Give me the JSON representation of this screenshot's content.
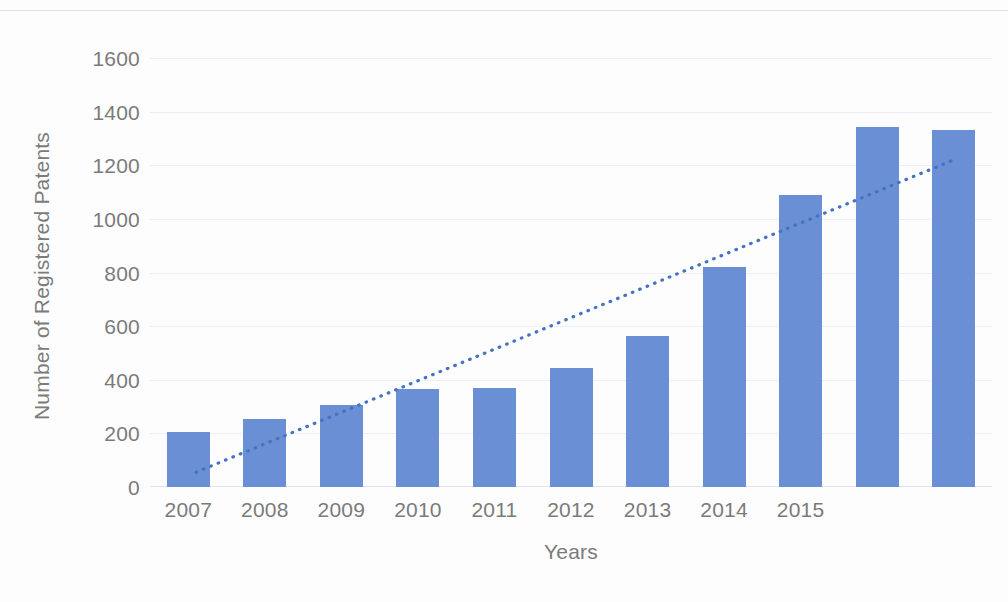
{
  "chart_data": {
    "type": "bar",
    "title": "",
    "xlabel": "Years",
    "ylabel": "Number of Registered Patents",
    "ylim": [
      0,
      1600
    ],
    "ytick_step": 200,
    "grid": true,
    "legend": null,
    "bar_color": "#6b8fd4",
    "trendline_color": "#4472c4",
    "trendline_style": "dotted",
    "axis_text_color": "#7b7b7b",
    "categories": [
      "2007",
      "2008",
      "2009",
      "2010",
      "2011",
      "2012",
      "2013",
      "2014",
      "2015",
      "",
      ""
    ],
    "values": [
      205,
      255,
      305,
      365,
      368,
      445,
      565,
      822,
      1090,
      1342,
      1330
    ],
    "ytick_labels": [
      "1600",
      "1400",
      "1200",
      "1000",
      "800",
      "600",
      "400",
      "200",
      "0"
    ],
    "ytick_values": [
      1600,
      1400,
      1200,
      1000,
      800,
      600,
      400,
      200,
      0
    ],
    "xtick_labels": [
      "2007",
      "2008",
      "2009",
      "2010",
      "2011",
      "2012",
      "2013",
      "2014",
      "2015"
    ],
    "trendline": {
      "x_start_value": 0.6,
      "y_start_value": 55,
      "x_end_value": 10.5,
      "y_end_value": 1220
    }
  }
}
